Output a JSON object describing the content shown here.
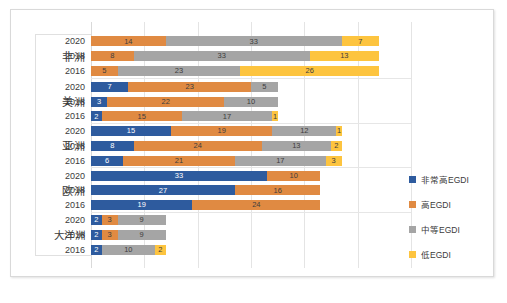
{
  "chart_data": {
    "type": "bar",
    "orientation": "horizontal",
    "stacked": true,
    "title": "",
    "subtitle": "",
    "xlabel": "",
    "ylabel": "",
    "xlim": [
      0,
      60
    ],
    "grid": true,
    "gridline_values": [
      0,
      10,
      20,
      30,
      40,
      50,
      60
    ],
    "legend_position": "right",
    "series": [
      {
        "name": "非常高EGDI",
        "color": "#2e5b9e",
        "key": "vhigh"
      },
      {
        "name": "高EGDI",
        "color": "#e08a42",
        "key": "high"
      },
      {
        "name": "中等EGDI",
        "color": "#a5a5a5",
        "key": "medium"
      },
      {
        "name": "低EGDI",
        "color": "#fdc43f",
        "key": "low"
      }
    ],
    "groups": [
      {
        "region": "非洲",
        "rows": [
          {
            "year": "2020",
            "values": [
              0,
              14,
              33,
              7
            ]
          },
          {
            "year": "2018",
            "values": [
              0,
              8,
              33,
              13
            ]
          },
          {
            "year": "2016",
            "values": [
              0,
              5,
              23,
              26
            ]
          }
        ]
      },
      {
        "region": "美洲",
        "rows": [
          {
            "year": "2020",
            "values": [
              7,
              23,
              5,
              0
            ]
          },
          {
            "year": "2018",
            "values": [
              3,
              22,
              10,
              0
            ]
          },
          {
            "year": "2016",
            "values": [
              2,
              15,
              17,
              1
            ]
          }
        ]
      },
      {
        "region": "亚洲",
        "rows": [
          {
            "year": "2020",
            "values": [
              15,
              19,
              12,
              1
            ]
          },
          {
            "year": "2018",
            "values": [
              8,
              24,
              13,
              2
            ]
          },
          {
            "year": "2016",
            "values": [
              6,
              21,
              17,
              3
            ]
          }
        ]
      },
      {
        "region": "欧洲",
        "rows": [
          {
            "year": "2020",
            "values": [
              33,
              10,
              0,
              0
            ]
          },
          {
            "year": "2018",
            "values": [
              27,
              16,
              0,
              0
            ]
          },
          {
            "year": "2016",
            "values": [
              19,
              24,
              0,
              0
            ]
          }
        ]
      },
      {
        "region": "大洋洲",
        "rows": [
          {
            "year": "2020",
            "values": [
              2,
              3,
              9,
              0
            ]
          },
          {
            "year": "2018",
            "values": [
              2,
              3,
              9,
              0
            ]
          },
          {
            "year": "2016",
            "values": [
              2,
              0,
              10,
              2
            ]
          }
        ]
      }
    ]
  }
}
